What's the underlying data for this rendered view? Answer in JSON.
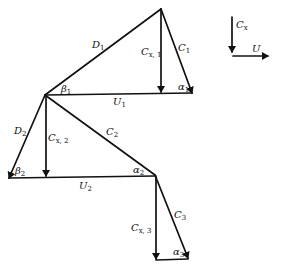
{
  "diagram": {
    "labels": {
      "D1": {
        "main": "D",
        "sub": "1"
      },
      "C1": {
        "main": "C",
        "sub": "1"
      },
      "Cx1": {
        "main": "C",
        "sub": "x, 1"
      },
      "beta1": {
        "main": "β",
        "sub": "1"
      },
      "alpha1": {
        "main": "α",
        "sub": "1"
      },
      "U1": {
        "main": "U",
        "sub": "1"
      },
      "D2": {
        "main": "D",
        "sub": "2"
      },
      "Cx2": {
        "main": "C",
        "sub": "x, 2"
      },
      "C2": {
        "main": "C",
        "sub": "2"
      },
      "beta2": {
        "main": "β",
        "sub": "2"
      },
      "alpha2": {
        "main": "α",
        "sub": "2"
      },
      "U2": {
        "main": "U",
        "sub": "2"
      },
      "C3": {
        "main": "C",
        "sub": "3"
      },
      "Cx3": {
        "main": "C",
        "sub": "x, 3"
      },
      "alpha3": {
        "main": "α",
        "sub": "3"
      }
    },
    "legend": {
      "cx": {
        "main": "C",
        "sub": "x"
      },
      "u": {
        "main": "U",
        "sub": ""
      }
    },
    "colors": {
      "line": "#111111",
      "background": "#ffffff"
    }
  }
}
